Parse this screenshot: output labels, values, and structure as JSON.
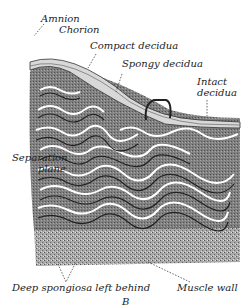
{
  "figure": {
    "panel_letter": "B",
    "labels": {
      "amnion": "Amnion",
      "chorion": "Chorion",
      "compact_decidua": "Compact decidua",
      "spongy_decidua": "Spongy decidua",
      "intact_decidua_line1": "Intact",
      "intact_decidua_line2": "decidua",
      "separation_plane_line1": "Separation",
      "separation_plane_line2": "plane",
      "deep_spongiosa": "Deep spongiosa left behind",
      "muscle_wall": "Muscle wall"
    }
  },
  "colors": {
    "ink": "#222222",
    "tissue_dark": "#555555",
    "tissue_mid": "#8a8a8a",
    "tissue_light": "#bdbdbd",
    "paper": "#ffffff"
  }
}
